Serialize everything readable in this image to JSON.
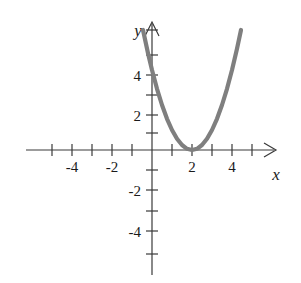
{
  "figure": {
    "title": "",
    "background_color": "#ffffff",
    "axis_color": "#3a3a3a",
    "curve_color": "#7f7f7f",
    "text_color": "#1a1a1a"
  },
  "axes": {
    "x_axis_label": "x",
    "y_axis_label": "y",
    "x_tick_labels": [
      "-4",
      "-2",
      "2",
      "4"
    ],
    "y_tick_labels": [
      "4",
      "2",
      "-2",
      "-4"
    ],
    "x_label_minus4": "-4",
    "x_label_minus2": "-2",
    "x_label_2": "2",
    "x_label_4": "4",
    "y_label_4": "4",
    "y_label_2": "2",
    "y_label_minus2": "-2",
    "y_label_minus4": "-4"
  },
  "chart_data": {
    "type": "line",
    "title": "",
    "xlabel": "x",
    "ylabel": "y",
    "xlim": [
      -5.5,
      5.5
    ],
    "ylim": [
      -5.5,
      6.7
    ],
    "grid": false,
    "legend": false,
    "x_ticks": [
      -5,
      -4,
      -3,
      -2,
      -1,
      1,
      2,
      3,
      4,
      5
    ],
    "x_tick_labels_shown": {
      "-4": "-4",
      "-2": "-2",
      "2": "2",
      "4": "4"
    },
    "y_ticks": [
      -5,
      -4,
      -3,
      -2,
      -1,
      1,
      2,
      3,
      4,
      5,
      6
    ],
    "y_tick_labels_shown": {
      "4": "4",
      "2": "2",
      "-2": "-2",
      "-4": "-4"
    },
    "equation": "y = (x - 2)^2",
    "vertex": [
      2,
      0
    ],
    "y_intercept": [
      0,
      4
    ],
    "x_intercept": [
      2,
      0
    ],
    "series": [
      {
        "name": "y = (x - 2)^2",
        "color": "#7f7f7f",
        "x": [
          -0.45,
          -0.2,
          0.0,
          0.25,
          0.5,
          0.75,
          1.0,
          1.25,
          1.5,
          1.75,
          2.0,
          2.25,
          2.5,
          2.75,
          3.0,
          3.25,
          3.5,
          3.75,
          4.0,
          4.25,
          4.45
        ],
        "values": [
          6.0,
          4.84,
          4.0,
          3.06,
          2.25,
          1.56,
          1.0,
          0.56,
          0.25,
          0.06,
          0.0,
          0.06,
          0.25,
          0.56,
          1.0,
          1.56,
          2.25,
          3.06,
          4.0,
          5.06,
          6.0
        ]
      }
    ]
  }
}
